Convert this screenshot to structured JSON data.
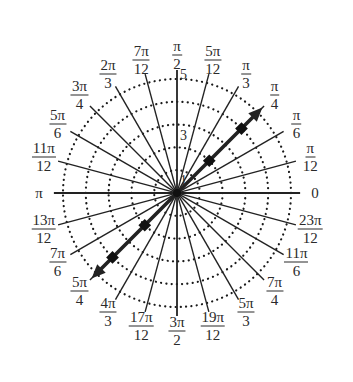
{
  "diagram": {
    "type": "polar-grid",
    "center": [
      177,
      193
    ],
    "unit_px": 22.8,
    "circles": [
      1,
      2,
      3,
      4,
      5
    ],
    "radial_labels": [
      {
        "value": "1",
        "r": 1
      },
      {
        "value": "3",
        "r": 3
      },
      {
        "value": "5",
        "r": 5
      }
    ],
    "spoke_length_units": 5.4,
    "angle_labels": [
      {
        "deg": 0,
        "num": "0",
        "den": ""
      },
      {
        "deg": 15,
        "num": "π",
        "den": "12"
      },
      {
        "deg": 30,
        "num": "π",
        "den": "6"
      },
      {
        "deg": 45,
        "num": "π",
        "den": "4"
      },
      {
        "deg": 60,
        "num": "π",
        "den": "3"
      },
      {
        "deg": 75,
        "num": "5π",
        "den": "12"
      },
      {
        "deg": 90,
        "num": "π",
        "den": "2"
      },
      {
        "deg": 105,
        "num": "7π",
        "den": "12"
      },
      {
        "deg": 120,
        "num": "2π",
        "den": "3"
      },
      {
        "deg": 135,
        "num": "3π",
        "den": "4"
      },
      {
        "deg": 150,
        "num": "5π",
        "den": "6"
      },
      {
        "deg": 165,
        "num": "11π",
        "den": "12"
      },
      {
        "deg": 180,
        "num": "π",
        "den": ""
      },
      {
        "deg": 195,
        "num": "13π",
        "den": "12"
      },
      {
        "deg": 210,
        "num": "7π",
        "den": "6"
      },
      {
        "deg": 225,
        "num": "5π",
        "den": "4"
      },
      {
        "deg": 240,
        "num": "4π",
        "den": "3"
      },
      {
        "deg": 255,
        "num": "17π",
        "den": "12"
      },
      {
        "deg": 270,
        "num": "3π",
        "den": "2"
      },
      {
        "deg": 285,
        "num": "19π",
        "den": "12"
      },
      {
        "deg": 300,
        "num": "5π",
        "den": "3"
      },
      {
        "deg": 315,
        "num": "7π",
        "den": "4"
      },
      {
        "deg": 330,
        "num": "11π",
        "den": "6"
      },
      {
        "deg": 345,
        "num": "23π",
        "den": "12"
      }
    ],
    "arrow_line": {
      "angle_deg": 45,
      "extent_units": 5.3,
      "both_directions": true,
      "markers_r": [
        2,
        4,
        -2,
        -4
      ]
    },
    "colors": {
      "line": "#222222",
      "dots": "#1a1a1a",
      "label": "#2a2a2a",
      "background": "#ffffff"
    }
  }
}
